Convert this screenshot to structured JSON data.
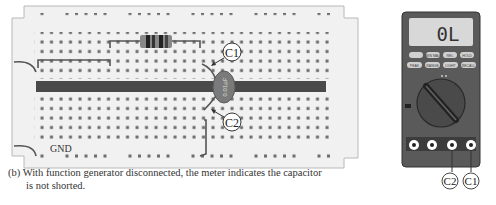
{
  "figure": {
    "caption_line1": "(b) With function generator disconnected, the meter indicates the capacitor",
    "caption_line2": "is not shorted."
  },
  "breadboard": {
    "labels": {
      "c1": "C1",
      "c2": "C2",
      "gnd": "GND",
      "capacitor_marking": "0.01µF"
    },
    "colors": {
      "board": "#f1f1f1",
      "board_border": "#b8b8b8",
      "hole": "#6a6a6a",
      "center_channel": "#4a4a4a",
      "wire": "#555555",
      "capacitor": "#7a7a7a"
    }
  },
  "multimeter": {
    "display": "0L",
    "buttons_row1": [
      "MIN MAX",
      "RANGE",
      "REL",
      "HOLD"
    ],
    "buttons_row2": [
      "PEAK",
      "RANGE",
      "LIGHT",
      "RECALL"
    ],
    "jacks": [
      "A",
      "mA",
      "COM",
      "VΩ"
    ],
    "probe_labels": {
      "c2": "C2",
      "c1": "C1"
    },
    "colors": {
      "body": "#5a5a5a",
      "display_bg": "#d8d8d8",
      "button": "#d0d0d0",
      "dial": "#444444"
    }
  }
}
